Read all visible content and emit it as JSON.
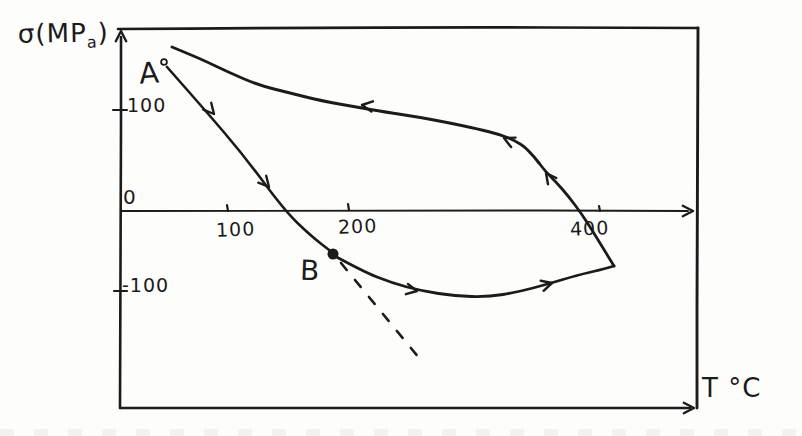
{
  "labels": {
    "y_axis_title": {
      "main": "σ(MP",
      "sub": "a",
      "close": ")"
    },
    "x_axis_title": "T °C",
    "point_a": "A",
    "point_b": "B"
  },
  "axis_ticks": {
    "y_100": "100",
    "y_0": "0",
    "y_neg_100": "-100",
    "x_100": "100",
    "x_200": "200",
    "x_400": "400"
  },
  "colors": {
    "ink": "#1b1b1b",
    "paper": "#fdfdfc"
  },
  "chart_data": {
    "type": "line",
    "xlabel": "T °C",
    "ylabel": "σ (MPa)",
    "x_ticks": [
      100,
      200,
      400
    ],
    "y_ticks": [
      100,
      0,
      -100
    ],
    "xlim": [
      0,
      480
    ],
    "ylim": [
      -250,
      180
    ],
    "grid": false,
    "legend": "none",
    "annotations": [
      {
        "label": "A",
        "T": 50,
        "sigma": 150,
        "marker": "open-circle",
        "role": "cycle start"
      },
      {
        "label": "B",
        "T": 185,
        "sigma": -50,
        "marker": "filled-dot",
        "role": "departure from elastic line"
      }
    ],
    "series": [
      {
        "name": "heating A to B (linear elastic)",
        "direction": "arrows point down-right (increasing T)",
        "points_T_sigma": [
          [
            50,
            150
          ],
          [
            100,
            95
          ],
          [
            145,
            0
          ],
          [
            185,
            -50
          ]
        ]
      },
      {
        "name": "heating B to max temperature (relaxation)",
        "direction": "arrows point right (increasing T)",
        "points_T_sigma": [
          [
            185,
            -50
          ],
          [
            240,
            -92
          ],
          [
            300,
            -106
          ],
          [
            355,
            -98
          ],
          [
            395,
            -80
          ],
          [
            420,
            -68
          ]
        ]
      },
      {
        "name": "cooling return branch back to A",
        "direction": "arrows point up then left (decreasing T)",
        "points_T_sigma": [
          [
            420,
            -68
          ],
          [
            390,
            0
          ],
          [
            355,
            58
          ],
          [
            320,
            80
          ],
          [
            260,
            98
          ],
          [
            200,
            112
          ],
          [
            140,
            132
          ],
          [
            90,
            152
          ],
          [
            45,
            178
          ]
        ]
      },
      {
        "name": "dashed extrapolation of elastic line beyond B",
        "style": "dashed",
        "points_T_sigma": [
          [
            190,
            -58
          ],
          [
            260,
            -190
          ]
        ]
      }
    ]
  },
  "geometry": {
    "stroke_width_default": 2.5,
    "strokes": [
      {
        "name": "frame-top",
        "w": 2.7,
        "pts": [
          [
            118,
            29
          ],
          [
            400,
            27
          ],
          [
            698,
            28
          ]
        ]
      },
      {
        "name": "frame-right",
        "w": 2.9,
        "pts": [
          [
            698,
            28
          ],
          [
            697,
            210
          ],
          [
            697,
            408
          ]
        ]
      },
      {
        "name": "frame-bottom",
        "w": 2.4,
        "pts": [
          [
            120,
            408
          ],
          [
            400,
            408
          ],
          [
            690,
            408
          ]
        ]
      },
      {
        "name": "y-axis",
        "w": 2.6,
        "pts": [
          [
            120,
            408
          ],
          [
            121,
            210
          ],
          [
            121,
            37
          ]
        ]
      },
      {
        "name": "zero-line",
        "w": 1.9,
        "pts": [
          [
            121,
            211
          ],
          [
            400,
            210
          ],
          [
            688,
            211
          ]
        ]
      },
      {
        "name": "segment-a-to-b",
        "w": 2.6,
        "pts": [
          [
            167,
            67
          ],
          [
            205,
            110
          ],
          [
            245,
            157
          ],
          [
            285,
            211
          ],
          [
            311,
            236
          ],
          [
            333,
            253
          ]
        ]
      },
      {
        "name": "lower-branch-b-to-vertex",
        "w": 2.8,
        "pts": [
          [
            333,
            255
          ],
          [
            362,
            271
          ],
          [
            392,
            283
          ],
          [
            422,
            291
          ],
          [
            455,
            296
          ],
          [
            488,
            297
          ],
          [
            518,
            292
          ],
          [
            548,
            284
          ],
          [
            578,
            275
          ],
          [
            600,
            270
          ],
          [
            614,
            266
          ]
        ]
      },
      {
        "name": "right-steep-branch",
        "w": 2.8,
        "pts": [
          [
            614,
            266
          ],
          [
            603,
            248
          ],
          [
            592,
            230
          ],
          [
            581,
            213
          ],
          [
            569,
            197
          ],
          [
            557,
            183
          ],
          [
            546,
            172
          ],
          [
            539,
            163
          ]
        ]
      },
      {
        "name": "upper-branch-return",
        "w": 2.9,
        "pts": [
          [
            539,
            163
          ],
          [
            528,
            149
          ],
          [
            514,
            140
          ],
          [
            498,
            134
          ],
          [
            478,
            129
          ],
          [
            450,
            123
          ],
          [
            418,
            117
          ],
          [
            385,
            112
          ],
          [
            362,
            108
          ],
          [
            322,
            101
          ],
          [
            290,
            93
          ],
          [
            258,
            85
          ],
          [
            228,
            72
          ],
          [
            203,
            60
          ],
          [
            184,
            52
          ],
          [
            172,
            47
          ]
        ]
      },
      {
        "name": "dashed-extrapolation",
        "w": 2.6,
        "dash": "9 13",
        "pts": [
          [
            341,
            263
          ],
          [
            424,
            364
          ]
        ]
      },
      {
        "name": "tick-y-100",
        "w": 2.2,
        "pts": [
          [
            113,
            110
          ],
          [
            127,
            110
          ]
        ]
      },
      {
        "name": "tick-y-neg100",
        "w": 2.2,
        "pts": [
          [
            114,
            291
          ],
          [
            127,
            291
          ]
        ]
      },
      {
        "name": "tick-x-100",
        "w": 2.2,
        "pts": [
          [
            227,
            205
          ],
          [
            228,
            211
          ]
        ]
      },
      {
        "name": "tick-x-200",
        "w": 2.2,
        "pts": [
          [
            348,
            204
          ],
          [
            349,
            210
          ]
        ]
      },
      {
        "name": "tick-x-400",
        "w": 2.2,
        "pts": [
          [
            599,
            206
          ],
          [
            600,
            211
          ]
        ]
      }
    ],
    "arrows": [
      {
        "name": "y-axis-arrow",
        "x": 121,
        "y": 31,
        "a": -90
      },
      {
        "name": "zero-line-arrow",
        "x": 693,
        "y": 211,
        "a": 0
      },
      {
        "name": "frame-bottom-arrow",
        "x": 694,
        "y": 408,
        "a": 0
      },
      {
        "name": "ab-arrow-1",
        "x": 214,
        "y": 114,
        "a": 49
      },
      {
        "name": "ab-arrow-2",
        "x": 269,
        "y": 187,
        "a": 49
      },
      {
        "name": "lower-arrow-1",
        "x": 417,
        "y": 291,
        "a": 11
      },
      {
        "name": "lower-arrow-2",
        "x": 552,
        "y": 283,
        "a": -16
      },
      {
        "name": "steep-arrow",
        "x": 546,
        "y": 173,
        "a": -127
      },
      {
        "name": "upper-arrow-small",
        "x": 504,
        "y": 138,
        "a": -155
      },
      {
        "name": "upper-arrow-main",
        "x": 362,
        "y": 105,
        "a": -172
      }
    ],
    "dots": [
      {
        "name": "point-b-dot",
        "x": 333,
        "y": 254,
        "r": 4.6,
        "fill": true
      },
      {
        "name": "point-a-start-circle",
        "x": 164,
        "y": 62,
        "r": 2.9,
        "fill": false
      }
    ]
  }
}
